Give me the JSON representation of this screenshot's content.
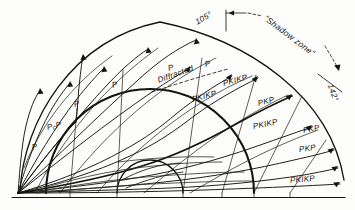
{
  "figure": {
    "kind": "seismic-ray-path-cross-section",
    "title": "",
    "background_color": "#fdfdfc",
    "ink_color": "#15150f"
  },
  "geometry": {
    "focus": {
      "x": 18,
      "y": 193
    },
    "surface_baseline": {
      "x1": 12,
      "y1": 197.5,
      "x2": 345,
      "y2": 197.5
    },
    "earth_surface_arc": {
      "cx": 178,
      "cy": 193,
      "rx": 166,
      "ry": 172
    },
    "core_mantle_boundary": {
      "cx": 150,
      "cy": 193,
      "r": 104
    },
    "inner_core_boundary": {
      "cx": 150,
      "cy": 193,
      "r": 33
    }
  },
  "annotations": {
    "angle_105": "105°",
    "angle_142": "142°",
    "shadow_zone": "\"Shadow zone\"",
    "diffracted": "Diffracted"
  },
  "phase_labels": [
    {
      "id": "p-left-lower",
      "text": "P",
      "x": 32,
      "y": 143,
      "rot": -14
    },
    {
      "id": "pcp",
      "text": "P",
      "x": 47,
      "y": 123,
      "rot": -12,
      "sub": "c",
      "tail": "P"
    },
    {
      "id": "p-mid-left",
      "text": "P",
      "x": 74,
      "y": 100,
      "rot": -14
    },
    {
      "id": "p-mid",
      "text": "P",
      "x": 112,
      "y": 81,
      "rot": -16
    },
    {
      "id": "p-upper",
      "text": "P",
      "x": 168,
      "y": 64,
      "rot": -16
    },
    {
      "id": "p-diffracted",
      "text": "P",
      "x": 205,
      "y": 60,
      "rot": -14
    },
    {
      "id": "pkikp-1",
      "text": "PKIKP",
      "x": 192,
      "y": 95,
      "rot": -15
    },
    {
      "id": "pkikp-2",
      "text": "PKIKP",
      "x": 223,
      "y": 79,
      "rot": -15
    },
    {
      "id": "pkp-1",
      "text": "PKP",
      "x": 258,
      "y": 99,
      "rot": -14
    },
    {
      "id": "pkikp-3",
      "text": "PKIKP",
      "x": 253,
      "y": 122,
      "rot": -11
    },
    {
      "id": "pkp-2",
      "text": "PKP",
      "x": 303,
      "y": 126,
      "rot": -10
    },
    {
      "id": "pkp-3",
      "text": "PKP",
      "x": 299,
      "y": 145,
      "rot": -7
    },
    {
      "id": "pkikp-4",
      "text": "PKIKP",
      "x": 290,
      "y": 176,
      "rot": -5
    }
  ],
  "rays": {
    "count_described": "seismic ray paths from focus through mantle, outer core and inner core",
    "p_waves": 5,
    "pkp_waves": 3,
    "pkikp_waves": 4
  }
}
